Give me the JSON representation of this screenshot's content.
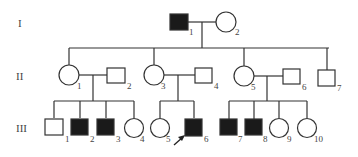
{
  "colors": {
    "affected": "#1a1a1a",
    "unaffected": "#ffffff",
    "line": "#333333"
  },
  "generations": [
    {
      "label": "I",
      "individuals": [
        {
          "id": "1",
          "sex": "male",
          "affected": true
        },
        {
          "id": "2",
          "sex": "female",
          "affected": false
        }
      ]
    },
    {
      "label": "II",
      "individuals": [
        {
          "id": "1",
          "sex": "female",
          "affected": false
        },
        {
          "id": "2",
          "sex": "male",
          "affected": false
        },
        {
          "id": "3",
          "sex": "female",
          "affected": false
        },
        {
          "id": "4",
          "sex": "male",
          "affected": false
        },
        {
          "id": "5",
          "sex": "female",
          "affected": false
        },
        {
          "id": "6",
          "sex": "male",
          "affected": false
        },
        {
          "id": "7",
          "sex": "male",
          "affected": false
        }
      ]
    },
    {
      "label": "III",
      "individuals": [
        {
          "id": "1",
          "sex": "male",
          "affected": false
        },
        {
          "id": "2",
          "sex": "male",
          "affected": true
        },
        {
          "id": "3",
          "sex": "male",
          "affected": true
        },
        {
          "id": "4",
          "sex": "female",
          "affected": false
        },
        {
          "id": "5",
          "sex": "female",
          "affected": false
        },
        {
          "id": "6",
          "sex": "male",
          "affected": true,
          "proband": true
        },
        {
          "id": "7",
          "sex": "male",
          "affected": true
        },
        {
          "id": "8",
          "sex": "male",
          "affected": true
        },
        {
          "id": "9",
          "sex": "female",
          "affected": false
        },
        {
          "id": "10",
          "sex": "female",
          "affected": false
        }
      ]
    }
  ]
}
